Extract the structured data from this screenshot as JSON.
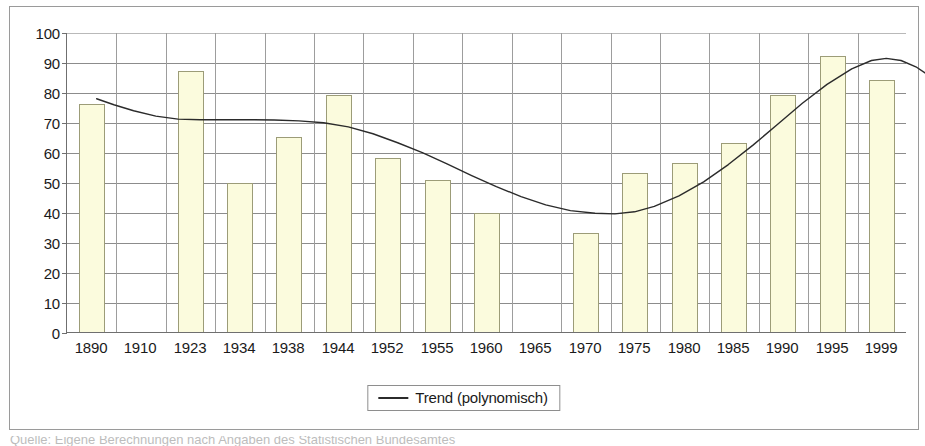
{
  "chart_data": {
    "type": "bar",
    "title": "",
    "xlabel": "",
    "ylabel": "",
    "ylim": [
      0,
      100
    ],
    "ytick_step": 10,
    "grid": true,
    "legend_position": "bottom",
    "categories": [
      "1890",
      "1910",
      "1923",
      "1934",
      "1938",
      "1944",
      "1952",
      "1955",
      "1960",
      "1965",
      "1970",
      "1975",
      "1980",
      "1985",
      "1990",
      "1995",
      "1999"
    ],
    "yticks": [
      "100",
      "90",
      "80",
      "70",
      "60",
      "50",
      "40",
      "30",
      "20",
      "10",
      "0"
    ],
    "series": [
      {
        "name": "Werte",
        "type": "bar",
        "values": [
          76,
          null,
          87,
          49.5,
          65,
          79,
          58,
          50.5,
          39.5,
          null,
          33,
          53,
          56.5,
          63,
          79,
          92,
          84
        ],
        "fill_color": "#fbfbdd",
        "border_color": "#9c9c78"
      },
      {
        "name": "Trend (polynomisch)",
        "type": "line",
        "color": "#2b2b2b",
        "values": [
          78,
          74.5,
          71.5,
          71,
          71,
          70.5,
          68.5,
          63,
          55,
          46,
          40,
          39.5,
          43,
          53.5,
          68.5,
          82,
          90.5
        ]
      }
    ],
    "trend_points": [
      [
        0.1,
        78.0
      ],
      [
        0.45,
        76.0
      ],
      [
        0.85,
        74.0
      ],
      [
        1.3,
        72.2
      ],
      [
        1.75,
        71.2
      ],
      [
        2.2,
        71.0
      ],
      [
        2.7,
        71.0
      ],
      [
        3.2,
        71.0
      ],
      [
        3.7,
        70.9
      ],
      [
        4.2,
        70.6
      ],
      [
        4.7,
        70.0
      ],
      [
        5.2,
        68.6
      ],
      [
        5.7,
        66.3
      ],
      [
        6.2,
        63.3
      ],
      [
        6.7,
        60.0
      ],
      [
        7.2,
        56.2
      ],
      [
        7.7,
        52.3
      ],
      [
        8.2,
        48.6
      ],
      [
        8.7,
        45.3
      ],
      [
        9.2,
        42.5
      ],
      [
        9.7,
        40.6
      ],
      [
        10.2,
        39.7
      ],
      [
        10.6,
        39.5
      ],
      [
        11.0,
        40.2
      ],
      [
        11.4,
        42.0
      ],
      [
        11.9,
        45.5
      ],
      [
        12.4,
        50.2
      ],
      [
        12.9,
        56.0
      ],
      [
        13.4,
        62.5
      ],
      [
        13.9,
        69.5
      ],
      [
        14.4,
        76.5
      ],
      [
        14.9,
        82.8
      ],
      [
        15.4,
        88.0
      ],
      [
        15.8,
        90.8
      ],
      [
        16.1,
        91.5
      ],
      [
        16.4,
        90.8
      ],
      [
        16.7,
        88.7
      ],
      [
        16.9,
        86.5
      ]
    ],
    "legend": [
      {
        "label": "Trend (polynomisch)",
        "marker": "line",
        "color": "#2b2b2b"
      }
    ]
  },
  "caption": {
    "text": "Quelle: Eigene Berechnungen nach Angaben des Statistischen Bundesamtes"
  }
}
